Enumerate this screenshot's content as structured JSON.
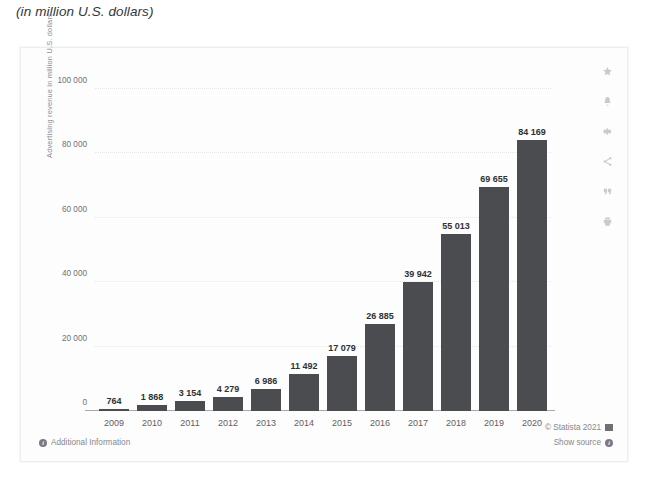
{
  "subtitle": "(in million U.S. dollars)",
  "chart_data": {
    "type": "bar",
    "title": "",
    "subtitle": "(in million U.S. dollars)",
    "xlabel": "",
    "ylabel": "Advertising revenue in million U.S. dollars",
    "ylim": [
      0,
      105000
    ],
    "yticks": [
      "0",
      "20 000",
      "40 000",
      "60 000",
      "80 000",
      "100 000"
    ],
    "ytick_values": [
      0,
      20000,
      40000,
      60000,
      80000,
      100000
    ],
    "grid": true,
    "legend": "none",
    "categories": [
      "2009",
      "2010",
      "2011",
      "2012",
      "2013",
      "2014",
      "2015",
      "2016",
      "2017",
      "2018",
      "2019",
      "2020"
    ],
    "values": [
      764,
      1868,
      3154,
      4279,
      6986,
      11492,
      17079,
      26885,
      39942,
      55013,
      69655,
      84169
    ],
    "value_labels": [
      "764",
      "1 868",
      "3 154",
      "4 279",
      "6 986",
      "11 492",
      "17 079",
      "26 885",
      "39 942",
      "55 013",
      "69 655",
      "84 169"
    ],
    "bar_color": "#4a4c50"
  },
  "icon_rail": [
    {
      "name": "star-icon",
      "label": "Favorite"
    },
    {
      "name": "bell-icon",
      "label": "Alert"
    },
    {
      "name": "gear-icon",
      "label": "Settings"
    },
    {
      "name": "share-icon",
      "label": "Share"
    },
    {
      "name": "quote-icon",
      "label": "Cite"
    },
    {
      "name": "print-icon",
      "label": "Print"
    }
  ],
  "footer": {
    "additional_information": "Additional Information",
    "copyright": "© Statista 2021",
    "show_source": "Show source"
  }
}
